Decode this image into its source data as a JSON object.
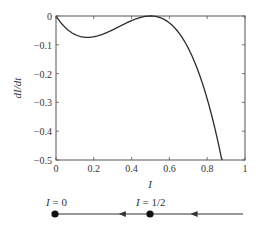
{
  "chart_data": {
    "type": "line",
    "title": "",
    "xlabel": "I",
    "ylabel": "dI/dt",
    "xlim": [
      0,
      1
    ],
    "ylim": [
      -0.5,
      0
    ],
    "grid": false,
    "x_ticks": [
      "0",
      "0.2",
      "0.4",
      "0.6",
      "0.8",
      "1"
    ],
    "y_ticks": [
      "0",
      "−0.1",
      "−0.2",
      "−0.3",
      "−0.4",
      "−0.5"
    ],
    "series": [
      {
        "name": "dI/dt",
        "x": [
          0,
          0.05,
          0.1,
          0.1667,
          0.2,
          0.25,
          0.3,
          0.35,
          0.4,
          0.45,
          0.5,
          0.55,
          0.6,
          0.65,
          0.7,
          0.75,
          0.8,
          0.85,
          0.88
        ],
        "y": [
          0,
          -0.041,
          -0.064,
          -0.074,
          -0.072,
          -0.0625,
          -0.048,
          -0.0315,
          -0.016,
          -0.0045,
          0,
          -0.0055,
          -0.024,
          -0.0585,
          -0.112,
          -0.1875,
          -0.288,
          -0.4165,
          -0.508
        ]
      }
    ],
    "annotations": []
  },
  "phase_line": {
    "points": [
      {
        "label": "I = 0",
        "value": 0,
        "type": "stable-equilibrium"
      },
      {
        "label": "I = 1/2",
        "value": 0.5,
        "type": "semi-stable-equilibrium"
      }
    ],
    "arrows": [
      {
        "position": 0.35,
        "direction": "left"
      },
      {
        "position": 0.72,
        "direction": "left"
      }
    ]
  },
  "colors": {
    "curve": "#2a2a2a",
    "axes": "#555555",
    "phase_line": "#333333",
    "dot": "#111111"
  }
}
